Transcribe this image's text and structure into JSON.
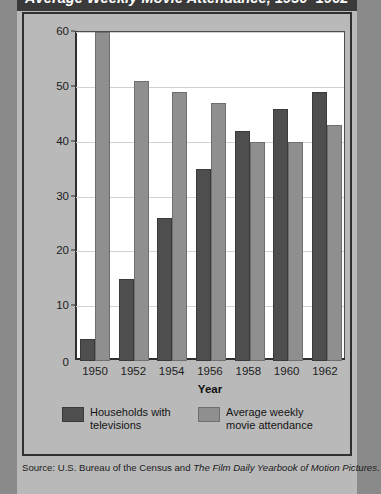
{
  "page": {
    "title": "Average Weekly Movie Attendance, 1950–1962",
    "source_prefix": "Source: U.S. Bureau of the Census and ",
    "source_italic": "The Film Daily Yearbook of Motion Pictures",
    "source_suffix": "."
  },
  "colors": {
    "page_background": "#9a9a9a",
    "card_background": "#b9b9b9",
    "title_band": "#3a3a3a",
    "plot_background": "#ffffff",
    "frame": "#2f2f2f",
    "gridline": "#d2d2d2",
    "series_tv": "#4e4e4e",
    "series_movie": "#8f8f8f"
  },
  "chart_data": {
    "type": "bar",
    "title": "Average Weekly Movie Attendance, 1950–1962",
    "xlabel": "Year",
    "ylabel": "Number (in millions)",
    "categories": [
      "1950",
      "1952",
      "1954",
      "1956",
      "1958",
      "1960",
      "1962"
    ],
    "ylim": [
      0,
      60
    ],
    "yticks": [
      0,
      10,
      20,
      30,
      40,
      50,
      60
    ],
    "ytick_labels": [
      "0",
      "10",
      "20",
      "30",
      "40",
      "50",
      "60"
    ],
    "grid": true,
    "legend_position": "bottom",
    "series": [
      {
        "name": "Households with televisions",
        "color": "#4e4e4e",
        "values": [
          4,
          15,
          26,
          35,
          42,
          46,
          49
        ]
      },
      {
        "name": "Average weekly movie attendance",
        "color": "#8f8f8f",
        "values": [
          60,
          51,
          49,
          47,
          40,
          40,
          43
        ]
      }
    ]
  }
}
